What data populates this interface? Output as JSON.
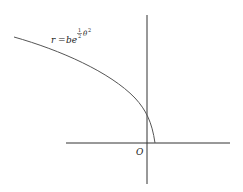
{
  "diagram": {
    "equation": {
      "lhs": "r",
      "eq": "=",
      "base": "be",
      "exp_fraction_num": "1",
      "exp_fraction_den": "2",
      "exp_var": "θ",
      "exp_power": "2"
    },
    "origin_label": "O",
    "colors": {
      "line": "#333333",
      "curve": "#555555",
      "text": "#222222"
    }
  }
}
